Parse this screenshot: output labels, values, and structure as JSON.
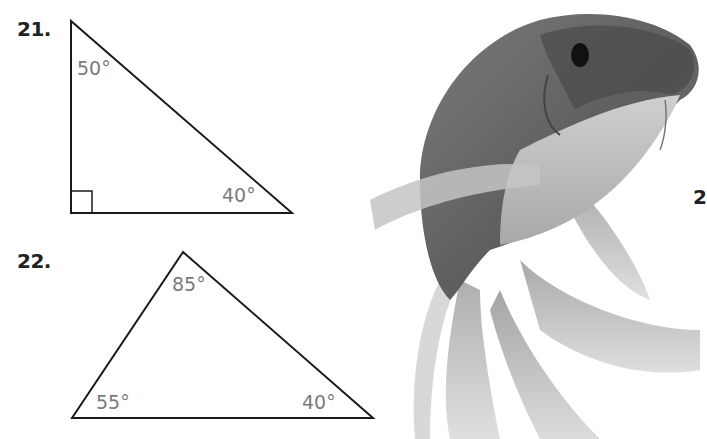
{
  "problems": [
    {
      "number": "21.",
      "shape": "right-triangle",
      "angles": {
        "top": "50°",
        "bottom_right": "40°",
        "bottom_left": "right-angle"
      }
    },
    {
      "number": "22.",
      "shape": "triangle",
      "angles": {
        "top": "85°",
        "bottom_left": "55°",
        "bottom_right": "40°"
      }
    }
  ],
  "partial_number": "2",
  "image": {
    "subject": "koi fish photo (grayscale)"
  },
  "colors": {
    "line": "#1a1a1a",
    "angle_text": "#7a7a7a",
    "number_text": "#222222"
  }
}
